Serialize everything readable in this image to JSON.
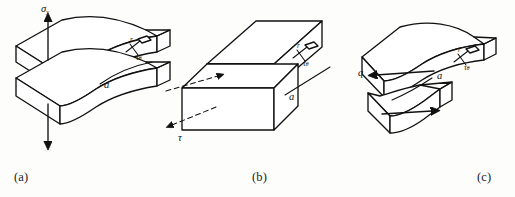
{
  "figure": {
    "background_color": "#fdfdfb",
    "ink_color": "#111111"
  },
  "panels": [
    {
      "id": "a",
      "caption": "(a)",
      "mode_name": "Mode I — opening",
      "labels": {
        "load": "σ",
        "load_subscript": "y",
        "crack_length": "a",
        "element_radius": "r",
        "element_stress": "τ",
        "element_stress_subscript": "θ"
      },
      "arrows": [
        {
          "name": "tension-arrow-up",
          "direction": "up"
        },
        {
          "name": "tension-arrow-down",
          "direction": "down"
        }
      ]
    },
    {
      "id": "b",
      "caption": "(b)",
      "mode_name": "Mode II — in-plane shear",
      "labels": {
        "load": "τ",
        "crack_length": "a",
        "element_radius": "r",
        "element_stress": "τ",
        "element_stress_subscript": "θ"
      },
      "arrows": [
        {
          "name": "shear-arrow-upper",
          "direction": "right"
        },
        {
          "name": "shear-arrow-lower",
          "direction": "left"
        }
      ]
    },
    {
      "id": "c",
      "caption": "(c)",
      "mode_name": "Mode III — tearing / anti-plane shear",
      "labels": {
        "load": "q",
        "crack_length": "a",
        "element_radius": "r",
        "element_stress": "τ",
        "element_stress_subscript": "θ"
      },
      "arrows": [
        {
          "name": "tear-arrow-upper",
          "direction": "left"
        },
        {
          "name": "tear-arrow-lower",
          "direction": "right"
        }
      ]
    }
  ]
}
